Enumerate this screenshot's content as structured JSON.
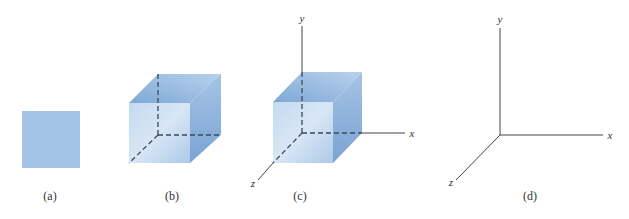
{
  "figure": {
    "panels": [
      {
        "id": "a",
        "caption": "(a)",
        "description": "2D square"
      },
      {
        "id": "b",
        "caption": "(b)",
        "description": "3D cube with hidden edges dashed"
      },
      {
        "id": "c",
        "caption": "(c)",
        "description": "3D cube placed at origin of x-y-z axes"
      },
      {
        "id": "d",
        "caption": "(d)",
        "description": "x-y-z coordinate axes"
      }
    ],
    "axes_labels": {
      "x": "x",
      "y": "y",
      "z": "z"
    },
    "colors": {
      "square_fill": "#a3c4e6",
      "cube_front": "#b4cfec",
      "cube_front_light": "#d4e4f5",
      "cube_top": "#8fb5de",
      "cube_side": "#7fa8d6",
      "axis_line": "#444444",
      "dashed_edge": "#3c4a5c"
    }
  }
}
